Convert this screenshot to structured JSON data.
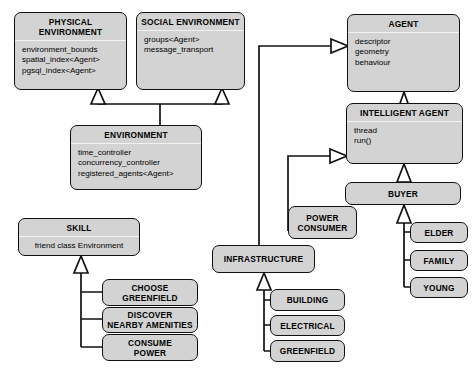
{
  "diagram": {
    "type": "uml-class-diagram",
    "colors": {
      "background": "#ffffff",
      "node_fill": "#d3d3d3",
      "node_border": "#111111",
      "compartment_divider": "#f2f2f2",
      "edge": "#111111",
      "arrowhead_fill": "#ffffff"
    },
    "relationship_type": "generalization"
  },
  "nodes": {
    "physical_environment": {
      "name": "PHYSICAL ENVIRONMENT",
      "attributes": "environment_bounds\nspatial_index<Agent>\npgsql_index<Agent>"
    },
    "social_environment": {
      "name": "SOCIAL ENVIRONMENT",
      "attributes": "groups<Agent>\nmessage_transport"
    },
    "environment": {
      "name": "ENVIRONMENT",
      "attributes": "time_controller\nconcurrency_controller\nregistered_agents<Agent>"
    },
    "agent": {
      "name": "AGENT",
      "attributes": "descriptor\ngeometry\nbehaviour"
    },
    "intelligent_agent": {
      "name": "INTELLIGENT AGENT",
      "attributes": "thread\nrun()"
    },
    "buyer": {
      "name": "BUYER"
    },
    "elder": {
      "name": "ELDER"
    },
    "family": {
      "name": "FAMILY"
    },
    "young": {
      "name": "YOUNG"
    },
    "power_consumer": {
      "name": "POWER\nCONSUMER"
    },
    "infrastructure": {
      "name": "INFRASTRUCTURE"
    },
    "building": {
      "name": "BUILDING"
    },
    "electrical": {
      "name": "ELECTRICAL"
    },
    "greenfield": {
      "name": "GREENFIELD"
    },
    "skill": {
      "name": "SKILL",
      "attributes": "friend class Environment"
    },
    "choose_greenfield": {
      "name": "CHOOSE\nGREENFIELD"
    },
    "discover_nearby_amenities": {
      "name": "DISCOVER\nNEARBY AMENITIES"
    },
    "consume_power": {
      "name": "CONSUME\nPOWER"
    }
  },
  "edges": [
    {
      "from": "environment",
      "to": "physical_environment",
      "kind": "generalization"
    },
    {
      "from": "environment",
      "to": "social_environment",
      "kind": "generalization"
    },
    {
      "from": "intelligent_agent",
      "to": "agent",
      "kind": "generalization"
    },
    {
      "from": "infrastructure",
      "to": "agent",
      "kind": "generalization"
    },
    {
      "from": "buyer",
      "to": "intelligent_agent",
      "kind": "generalization"
    },
    {
      "from": "power_consumer",
      "to": "intelligent_agent",
      "kind": "generalization"
    },
    {
      "from": "elder",
      "to": "buyer",
      "kind": "generalization"
    },
    {
      "from": "family",
      "to": "buyer",
      "kind": "generalization"
    },
    {
      "from": "young",
      "to": "buyer",
      "kind": "generalization"
    },
    {
      "from": "building",
      "to": "infrastructure",
      "kind": "generalization"
    },
    {
      "from": "electrical",
      "to": "infrastructure",
      "kind": "generalization"
    },
    {
      "from": "greenfield",
      "to": "infrastructure",
      "kind": "generalization"
    },
    {
      "from": "choose_greenfield",
      "to": "skill",
      "kind": "generalization"
    },
    {
      "from": "discover_nearby_amenities",
      "to": "skill",
      "kind": "generalization"
    },
    {
      "from": "consume_power",
      "to": "skill",
      "kind": "generalization"
    }
  ]
}
